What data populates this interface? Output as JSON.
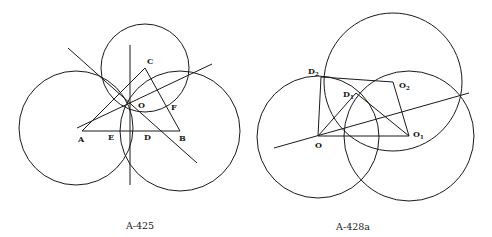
{
  "figures": [
    {
      "id": "left",
      "caption": "A-425",
      "circles": [
        {
          "name": "left-circle",
          "cx": 76,
          "cy": 128,
          "r": 57
        },
        {
          "name": "right-circle",
          "cx": 180,
          "cy": 131,
          "r": 60
        },
        {
          "name": "top-circle",
          "cx": 145,
          "cy": 68,
          "r": 44
        }
      ],
      "points": {
        "A": {
          "x": 82,
          "y": 130,
          "label": "A"
        },
        "B": {
          "x": 180,
          "y": 131,
          "label": "B"
        },
        "C": {
          "x": 145,
          "y": 68,
          "label": "C"
        },
        "O": {
          "x": 129,
          "y": 103,
          "label": "O"
        },
        "E": {
          "x": 118,
          "y": 131,
          "label": "E"
        },
        "D": {
          "x": 142,
          "y": 131,
          "label": "D"
        },
        "F": {
          "x": 166,
          "y": 107,
          "label": "F"
        }
      },
      "labels": [
        {
          "text": "A",
          "x": 78,
          "y": 142
        },
        {
          "text": "E",
          "x": 108,
          "y": 140
        },
        {
          "text": "D",
          "x": 144,
          "y": 140
        },
        {
          "text": "B",
          "x": 179,
          "y": 141
        },
        {
          "text": "C",
          "x": 147,
          "y": 64
        },
        {
          "text": "O",
          "x": 138,
          "y": 108
        },
        {
          "text": "F",
          "x": 171,
          "y": 110
        }
      ],
      "lines": [
        {
          "name": "segment-AB",
          "x1": 82,
          "y1": 131,
          "x2": 180,
          "y2": 131
        },
        {
          "name": "segment-BC",
          "x1": 180,
          "y1": 131,
          "x2": 145,
          "y2": 68
        },
        {
          "name": "segment-AC",
          "x1": 82,
          "y1": 131,
          "x2": 145,
          "y2": 68
        },
        {
          "name": "vertical-bisector",
          "x1": 130,
          "y1": 45,
          "x2": 130,
          "y2": 185
        },
        {
          "name": "diagonal-bisector",
          "x1": 68,
          "y1": 48,
          "x2": 197,
          "y2": 163
        },
        {
          "name": "rising-bisector",
          "x1": 77,
          "y1": 128,
          "x2": 212,
          "y2": 64
        }
      ]
    },
    {
      "id": "right",
      "caption": "A-428a",
      "circles": [
        {
          "name": "left-circle",
          "cx": 318,
          "cy": 137,
          "r": 61
        },
        {
          "name": "top-circle",
          "cx": 393,
          "cy": 82,
          "r": 69
        },
        {
          "name": "right-circle",
          "cx": 409,
          "cy": 136,
          "r": 65
        }
      ],
      "points": {
        "O": {
          "x": 318,
          "y": 136,
          "label": "O"
        },
        "O1": {
          "x": 409,
          "y": 136,
          "label": "O",
          "sub": "1"
        },
        "O2": {
          "x": 393,
          "y": 82,
          "label": "O",
          "sub": "2"
        },
        "D1": {
          "x": 356,
          "y": 93,
          "label": "D",
          "sub": "1"
        },
        "D2": {
          "x": 321,
          "y": 77,
          "label": "D",
          "sub": "2"
        }
      },
      "labels": [
        {
          "text": "O",
          "sub": "",
          "x": 315,
          "y": 148
        },
        {
          "text": "O",
          "sub": "1",
          "x": 413,
          "y": 137
        },
        {
          "text": "O",
          "sub": "2",
          "x": 399,
          "y": 88
        },
        {
          "text": "D",
          "sub": "1",
          "x": 343,
          "y": 97
        },
        {
          "text": "D",
          "sub": "2",
          "x": 308,
          "y": 74
        }
      ],
      "lines": [
        {
          "name": "segment-O-O1",
          "x1": 318,
          "y1": 136,
          "x2": 409,
          "y2": 136
        },
        {
          "name": "segment-O-D2",
          "x1": 318,
          "y1": 136,
          "x2": 321,
          "y2": 77
        },
        {
          "name": "segment-D2-O2",
          "x1": 321,
          "y1": 77,
          "x2": 393,
          "y2": 82
        },
        {
          "name": "segment-O2-O1",
          "x1": 393,
          "y1": 82,
          "x2": 409,
          "y2": 136
        },
        {
          "name": "segment-O-D1",
          "x1": 318,
          "y1": 136,
          "x2": 356,
          "y2": 93
        },
        {
          "name": "segment-D1-O1",
          "x1": 356,
          "y1": 93,
          "x2": 409,
          "y2": 136
        },
        {
          "name": "secant-line",
          "x1": 274,
          "y1": 148,
          "x2": 469,
          "y2": 93
        }
      ]
    }
  ],
  "captions": {
    "left": {
      "text": "A-425",
      "x": 140,
      "y": 229
    },
    "right": {
      "text": "A-428a",
      "x": 353,
      "y": 230
    }
  }
}
